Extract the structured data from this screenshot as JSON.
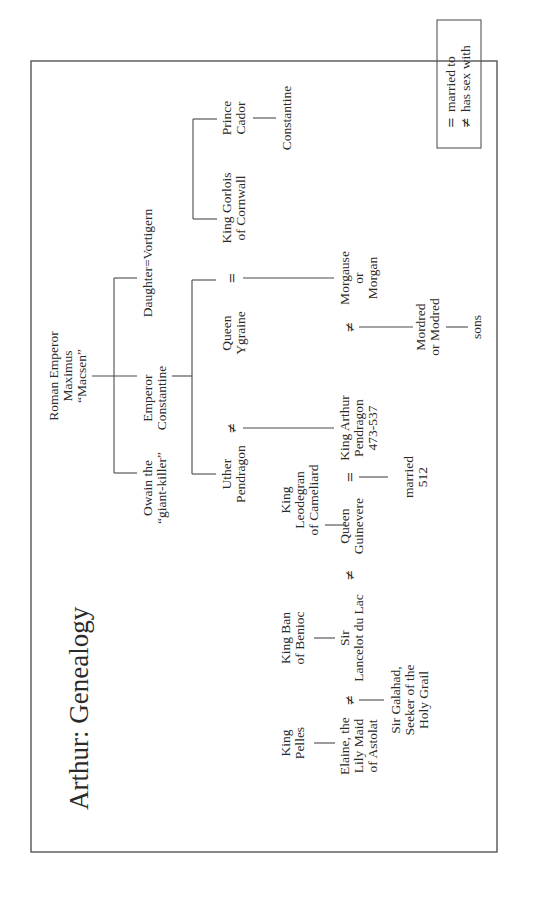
{
  "title": "Arthur: Genealogy",
  "people": {
    "maximus": [
      "Roman Emperor",
      "Maximus",
      "“Macsen”"
    ],
    "owain": [
      "Owain the",
      "“giant-killer”"
    ],
    "constantine_emperor": [
      "Emperor",
      "Constantine"
    ],
    "daughter_vortigern": [
      "Daughter=Vortigern"
    ],
    "uther": [
      "Uther",
      "Pendragon"
    ],
    "aurelius": [
      "Aurelius",
      "Ambrosius",
      "“Emrys”",
      "d. 485"
    ],
    "prince_cador": [
      "Prince",
      "Cador"
    ],
    "gorlois": [
      "King Gorlois",
      "of Cornwall"
    ],
    "ygraine": [
      "Queen",
      "Ygraine"
    ],
    "constantine_son": [
      "Constantine"
    ],
    "morgause": [
      "Morgause",
      "or",
      "Morgan"
    ],
    "arthur": [
      "King Arthur",
      "Pendragon",
      "473-537"
    ],
    "leodegran": [
      "King",
      "Leodegran",
      "of Cameliard"
    ],
    "guinevere": [
      "Queen",
      "Guinevere"
    ],
    "ban": [
      "King Ban",
      "of Benioc"
    ],
    "lancelot": [
      "Sir",
      "Lancelot du Lac"
    ],
    "pelles": [
      "King",
      "Pelles"
    ],
    "elaine": [
      "Elaine, the",
      "Lily Maid",
      "of Astolat"
    ],
    "galahad": [
      "Sir Galahad,",
      "Seeker of the",
      "Holy Grail"
    ],
    "married": [
      "married",
      "512"
    ],
    "mordred": [
      "Mordred",
      "or Modred"
    ],
    "sons": [
      "sons"
    ]
  },
  "relations": {
    "gorlois_ygraine": "=",
    "ygraine_uther": "≠",
    "morgause_arthur": "≠",
    "arthur_guinevere": "=",
    "guinevere_lancelot": "≠",
    "lancelot_elaine": "≠"
  },
  "legend": {
    "items": [
      {
        "symbol": "=",
        "label": "married to"
      },
      {
        "symbol": "≠",
        "label": "has sex with"
      }
    ]
  },
  "colors": {
    "ink": "#2a2a2a",
    "line": "#4a4a4a",
    "frame": "#555555",
    "paper": "#ffffff"
  }
}
